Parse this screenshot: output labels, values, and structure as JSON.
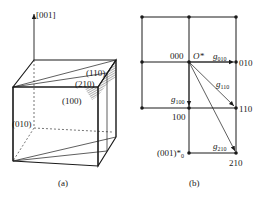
{
  "panel_a": {
    "caption": "(a)",
    "axis_label": "[001]",
    "plane_labels": {
      "p110": "(110)",
      "p210": "(210)",
      "p100": "(100)",
      "p010": "(010)"
    }
  },
  "panel_b": {
    "caption": "(b)",
    "origin_index": "000",
    "origin_symbol": "O*",
    "layer_label": "(001)*",
    "layer_sub": "0",
    "points": {
      "p010": "010",
      "p100": "100",
      "p110": "110",
      "p210": "210"
    },
    "vectors": {
      "g010": {
        "g": "g",
        "sub": "010"
      },
      "g100": {
        "g": "g",
        "sub": "100"
      },
      "g110": {
        "g": "g",
        "sub": "110"
      },
      "g210": {
        "g": "g",
        "sub": "210"
      }
    }
  },
  "colors": {
    "ink": "#1a1a1a",
    "background": "#ffffff"
  }
}
